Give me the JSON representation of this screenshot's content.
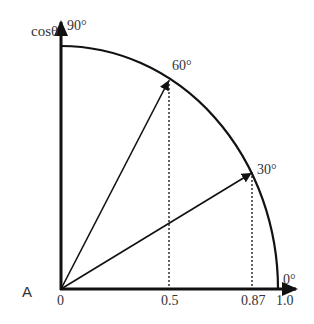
{
  "diagram": {
    "panel_label": "A",
    "y_axis_label": "cosθ",
    "angle_labels": [
      "90°",
      "60°",
      "30°",
      "0°"
    ],
    "x_tick_labels": [
      "0",
      "0.5",
      "0.87",
      "1.0"
    ],
    "vectors": [
      {
        "angle_deg": 60,
        "x": 0.5,
        "label": "60°"
      },
      {
        "angle_deg": 30,
        "x": 0.87,
        "label": "30°"
      }
    ],
    "colors": {
      "stroke": "#111111",
      "text": "#333333",
      "background": "#ffffff"
    }
  }
}
